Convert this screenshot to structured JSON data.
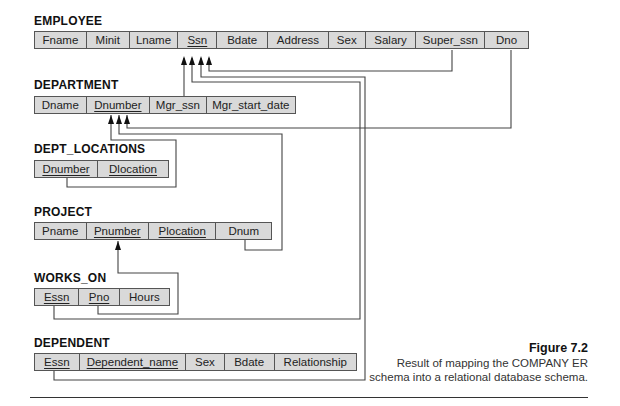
{
  "relations": {
    "employee": {
      "name": "EMPLOYEE",
      "attributes": [
        {
          "label": "Fname",
          "pk": false
        },
        {
          "label": "Minit",
          "pk": false
        },
        {
          "label": "Lname",
          "pk": false
        },
        {
          "label": "Ssn",
          "pk": true
        },
        {
          "label": "Bdate",
          "pk": false
        },
        {
          "label": "Address",
          "pk": false
        },
        {
          "label": "Sex",
          "pk": false
        },
        {
          "label": "Salary",
          "pk": false
        },
        {
          "label": "Super_ssn",
          "pk": false
        },
        {
          "label": "Dno",
          "pk": false
        }
      ]
    },
    "department": {
      "name": "DEPARTMENT",
      "attributes": [
        {
          "label": "Dname",
          "pk": false
        },
        {
          "label": "Dnumber",
          "pk": true
        },
        {
          "label": "Mgr_ssn",
          "pk": false
        },
        {
          "label": "Mgr_start_date",
          "pk": false
        }
      ]
    },
    "dept_locations": {
      "name": "DEPT_LOCATIONS",
      "attributes": [
        {
          "label": "Dnumber",
          "pk": true
        },
        {
          "label": "Dlocation",
          "pk": true
        }
      ]
    },
    "project": {
      "name": "PROJECT",
      "attributes": [
        {
          "label": "Pname",
          "pk": false
        },
        {
          "label": "Pnumber",
          "pk": true
        },
        {
          "label": "Plocation",
          "pk": true
        },
        {
          "label": "Dnum",
          "pk": false
        }
      ]
    },
    "works_on": {
      "name": "WORKS_ON",
      "attributes": [
        {
          "label": "Essn",
          "pk": true
        },
        {
          "label": "Pno",
          "pk": true
        },
        {
          "label": "Hours",
          "pk": false
        }
      ]
    },
    "dependent": {
      "name": "DEPENDENT",
      "attributes": [
        {
          "label": "Essn",
          "pk": true
        },
        {
          "label": "Dependent_name",
          "pk": true
        },
        {
          "label": "Sex",
          "pk": false
        },
        {
          "label": "Bdate",
          "pk": false
        },
        {
          "label": "Relationship",
          "pk": false
        }
      ]
    }
  },
  "foreign_keys": [
    {
      "from": "DEPARTMENT.Mgr_ssn",
      "to": "EMPLOYEE.Ssn"
    },
    {
      "from": "EMPLOYEE.Super_ssn",
      "to": "EMPLOYEE.Ssn"
    },
    {
      "from": "WORKS_ON.Essn",
      "to": "EMPLOYEE.Ssn"
    },
    {
      "from": "DEPENDENT.Essn",
      "to": "EMPLOYEE.Ssn"
    },
    {
      "from": "EMPLOYEE.Dno",
      "to": "DEPARTMENT.Dnumber"
    },
    {
      "from": "PROJECT.Dnum",
      "to": "DEPARTMENT.Dnumber"
    },
    {
      "from": "DEPT_LOCATIONS.Dnumber",
      "to": "DEPARTMENT.Dnumber"
    },
    {
      "from": "WORKS_ON.Pno",
      "to": "PROJECT.Pnumber"
    }
  ],
  "caption": {
    "figure": "Figure 7.2",
    "line1": "Result of mapping the COMPANY ER",
    "line2": "schema into a relational database schema."
  },
  "colors": {
    "cell_fill": "#d9d9d9",
    "line": "#444444"
  }
}
